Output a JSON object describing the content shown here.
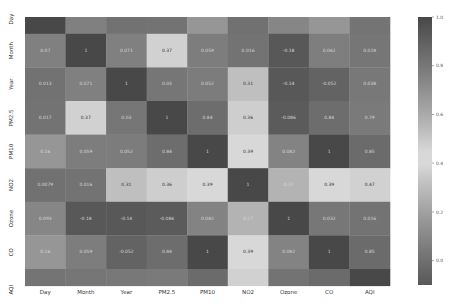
{
  "chart_data": {
    "type": "heatmap",
    "title": "",
    "xlabel": "",
    "ylabel": "",
    "x_categories": [
      "Day",
      "Month",
      "Year",
      "PM2.5",
      "PM10",
      "NO2",
      "Ozone",
      "CO",
      "AQI"
    ],
    "y_categories": [
      "Day",
      "Month",
      "Year",
      "PM2.5",
      "PM10",
      "NO2",
      "Ozone",
      "CO",
      "AQI"
    ],
    "values": [
      [
        1,
        0.07,
        0.013,
        0.017,
        0.16,
        0.0079,
        0.093,
        0.16,
        0.019
      ],
      [
        0.07,
        1,
        0.071,
        0.37,
        0.059,
        0.016,
        -0.18,
        0.061,
        0.028
      ],
      [
        0.013,
        0.071,
        1,
        0.03,
        0.052,
        0.31,
        -0.14,
        -0.052,
        0.038
      ],
      [
        0.017,
        0.37,
        0.03,
        1,
        0.84,
        0.36,
        -0.086,
        0.84,
        0.79
      ],
      [
        0.16,
        0.059,
        0.052,
        0.84,
        1,
        0.39,
        0.082,
        1,
        0.85
      ],
      [
        0.0079,
        0.016,
        0.31,
        0.36,
        0.39,
        1,
        0.27,
        0.39,
        0.47
      ],
      [
        0.093,
        -0.18,
        -0.14,
        -0.086,
        0.082,
        0.27,
        1,
        0.032,
        0.016
      ],
      [
        0.16,
        0.059,
        -0.052,
        0.84,
        1,
        0.39,
        0.082,
        1,
        0.85
      ],
      [
        0.019,
        0.028,
        0.038,
        0.79,
        0.85,
        0.47,
        0.016,
        0.85,
        1
      ]
    ],
    "value_labels": [
      [
        "",
        "",
        "",
        "",
        "",
        "",
        "",
        "",
        ""
      ],
      [
        "0.07",
        "1",
        "0.071",
        "0.37",
        "0.059",
        "0.016",
        "-0.18",
        "0.061",
        "0.028"
      ],
      [
        "0.013",
        "0.071",
        "1",
        "0.03",
        "0.052",
        "0.31",
        "-0.14",
        "-0.052",
        "0.038"
      ],
      [
        "0.017",
        "0.37",
        "0.03",
        "1",
        "0.84",
        "0.36",
        "-0.086",
        "0.84",
        "0.79"
      ],
      [
        "0.16",
        "0.059",
        "0.052",
        "0.84",
        "1",
        "0.39",
        "0.082",
        "1",
        "0.85"
      ],
      [
        "0.0079",
        "0.016",
        "0.31",
        "0.36",
        "0.39",
        "1",
        "0.27",
        "0.39",
        "0.47"
      ],
      [
        "0.093",
        "-0.18",
        "-0.14",
        "-0.086",
        "0.082",
        "0.27",
        "1",
        "0.032",
        "0.016"
      ],
      [
        "0.16",
        "0.059",
        "-0.052",
        "0.84",
        "1",
        "0.39",
        "0.082",
        "1",
        "0.85"
      ],
      [
        "",
        "",
        "",
        "",
        "",
        "",
        "",
        "",
        ""
      ]
    ],
    "visible_row_fraction": {
      "first": 0.5,
      "last": 0.5
    },
    "colormap": "diverging grayscale (dark-light-dark)",
    "vmin": -0.1,
    "vmax": 1.0,
    "colorbar_ticks": [
      "1.0",
      "0.8",
      "0.6",
      "0.4",
      "0.2",
      "0.0"
    ],
    "colorbar_tick_values": [
      1.0,
      0.8,
      0.6,
      0.4,
      0.2,
      0.0
    ],
    "legend_position": "right"
  }
}
